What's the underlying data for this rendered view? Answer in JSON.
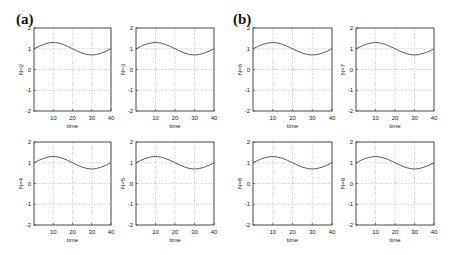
{
  "panels": [
    {
      "label": "(a)"
    },
    {
      "label": "(b)"
    }
  ],
  "chart_data": [
    {
      "type": "line",
      "panel": "(a)",
      "ylabel": "N=2",
      "xlabel": "time",
      "xlim": [
        0,
        40
      ],
      "ylim": [
        -2,
        2
      ],
      "xticks": [
        10,
        20,
        30,
        40
      ],
      "yticks": [
        -2,
        -1,
        0,
        1,
        2
      ],
      "grid": true,
      "series": [
        {
          "name": "N=2",
          "x": [
            0,
            5,
            10,
            15,
            20,
            25,
            30,
            35,
            40
          ],
          "y": [
            1.0,
            1.21,
            1.3,
            1.21,
            1.0,
            0.79,
            0.7,
            0.79,
            1.0
          ]
        }
      ]
    },
    {
      "type": "line",
      "panel": "(a)",
      "ylabel": "N=3",
      "xlabel": "time",
      "xlim": [
        0,
        40
      ],
      "ylim": [
        -2,
        2
      ],
      "xticks": [
        10,
        20,
        30,
        40
      ],
      "yticks": [
        -2,
        -1,
        0,
        1,
        2
      ],
      "grid": true,
      "series": [
        {
          "name": "N=3",
          "x": [
            0,
            5,
            10,
            15,
            20,
            25,
            30,
            35,
            40
          ],
          "y": [
            1.0,
            1.21,
            1.3,
            1.21,
            1.0,
            0.79,
            0.7,
            0.79,
            1.0
          ]
        }
      ]
    },
    {
      "type": "line",
      "panel": "(a)",
      "ylabel": "N=4",
      "xlabel": "time",
      "xlim": [
        0,
        40
      ],
      "ylim": [
        -2,
        2
      ],
      "xticks": [
        10,
        20,
        30,
        40
      ],
      "yticks": [
        -2,
        -1,
        0,
        1,
        2
      ],
      "grid": true,
      "series": [
        {
          "name": "N=4",
          "x": [
            0,
            5,
            10,
            15,
            20,
            25,
            30,
            35,
            40
          ],
          "y": [
            1.0,
            1.21,
            1.3,
            1.21,
            1.0,
            0.79,
            0.7,
            0.79,
            1.0
          ]
        }
      ]
    },
    {
      "type": "line",
      "panel": "(a)",
      "ylabel": "N=5",
      "xlabel": "time",
      "xlim": [
        0,
        40
      ],
      "ylim": [
        -2,
        2
      ],
      "xticks": [
        10,
        20,
        30,
        40
      ],
      "yticks": [
        -2,
        -1,
        0,
        1,
        2
      ],
      "grid": true,
      "series": [
        {
          "name": "N=5",
          "x": [
            0,
            5,
            10,
            15,
            20,
            25,
            30,
            35,
            40
          ],
          "y": [
            1.0,
            1.21,
            1.3,
            1.21,
            1.0,
            0.79,
            0.7,
            0.79,
            1.0
          ]
        }
      ]
    },
    {
      "type": "line",
      "panel": "(b)",
      "ylabel": "N=6",
      "xlabel": "time",
      "xlim": [
        0,
        40
      ],
      "ylim": [
        -2,
        2
      ],
      "xticks": [
        10,
        20,
        30,
        40
      ],
      "yticks": [
        -2,
        -1,
        0,
        1,
        2
      ],
      "grid": true,
      "series": [
        {
          "name": "N=6",
          "x": [
            0,
            5,
            10,
            15,
            20,
            25,
            30,
            35,
            40
          ],
          "y": [
            1.0,
            1.21,
            1.3,
            1.21,
            1.0,
            0.79,
            0.7,
            0.79,
            1.0
          ]
        }
      ]
    },
    {
      "type": "line",
      "panel": "(b)",
      "ylabel": "N=7",
      "xlabel": "time",
      "xlim": [
        0,
        40
      ],
      "ylim": [
        -2,
        2
      ],
      "xticks": [
        10,
        20,
        30,
        40
      ],
      "yticks": [
        -2,
        -1,
        0,
        1,
        2
      ],
      "grid": true,
      "series": [
        {
          "name": "N=7",
          "x": [
            0,
            5,
            10,
            15,
            20,
            25,
            30,
            35,
            40
          ],
          "y": [
            1.0,
            1.21,
            1.3,
            1.21,
            1.0,
            0.79,
            0.7,
            0.79,
            1.0
          ]
        }
      ]
    },
    {
      "type": "line",
      "panel": "(b)",
      "ylabel": "N=8",
      "xlabel": "time",
      "xlim": [
        0,
        40
      ],
      "ylim": [
        -2,
        2
      ],
      "xticks": [
        10,
        20,
        30,
        40
      ],
      "yticks": [
        -2,
        -1,
        0,
        1,
        2
      ],
      "grid": true,
      "series": [
        {
          "name": "N=8",
          "x": [
            0,
            5,
            10,
            15,
            20,
            25,
            30,
            35,
            40
          ],
          "y": [
            1.0,
            1.21,
            1.3,
            1.21,
            1.0,
            0.79,
            0.7,
            0.79,
            1.0
          ]
        }
      ]
    },
    {
      "type": "line",
      "panel": "(b)",
      "ylabel": "N=9",
      "xlabel": "time",
      "xlim": [
        0,
        40
      ],
      "ylim": [
        -2,
        2
      ],
      "xticks": [
        10,
        20,
        30,
        40
      ],
      "yticks": [
        -2,
        -1,
        0,
        1,
        2
      ],
      "grid": true,
      "series": [
        {
          "name": "N=9",
          "x": [
            0,
            5,
            10,
            15,
            20,
            25,
            30,
            35,
            40
          ],
          "y": [
            1.0,
            1.21,
            1.3,
            1.21,
            1.0,
            0.79,
            0.7,
            0.79,
            1.0
          ]
        }
      ]
    }
  ]
}
